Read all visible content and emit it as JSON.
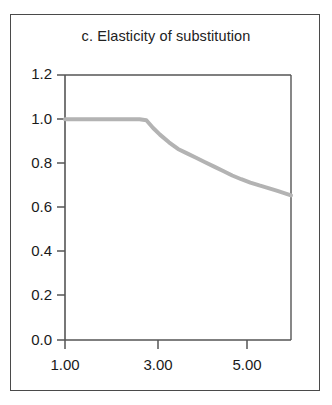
{
  "figure": {
    "title": "c. Elasticity of substitution",
    "background_color": "#ffffff",
    "frame_color": "#4a4a4a",
    "axis_color": "#555555",
    "curve_color": "#b3b3b3"
  },
  "chart_data": {
    "type": "line",
    "title": "c. Elasticity of substitution",
    "xlabel": "",
    "ylabel": "",
    "xlim": [
      1.0,
      6.0
    ],
    "ylim": [
      0.0,
      1.2
    ],
    "grid": false,
    "legend": null,
    "xticks": [
      1.0,
      3.0,
      5.0
    ],
    "xtick_labels": [
      "1.00",
      "3.00",
      "5.00"
    ],
    "yticks": [
      0.0,
      0.2,
      0.4,
      0.6,
      0.8,
      1.0,
      1.2
    ],
    "ytick_labels": [
      "0.0",
      "0.2",
      "0.4",
      "0.6",
      "0.8",
      "1.0",
      "1.2"
    ],
    "series": [
      {
        "name": "Elasticity of substitution",
        "color": "#b3b3b3",
        "x": [
          1.0,
          1.25,
          1.5,
          1.75,
          2.0,
          2.25,
          2.5,
          2.65,
          2.8,
          2.95,
          3.1,
          3.3,
          3.5,
          3.7,
          3.9,
          4.1,
          4.3,
          4.5,
          4.7,
          4.9,
          5.1,
          5.3,
          5.5,
          5.7,
          5.9,
          6.0
        ],
        "y": [
          1.0,
          1.0,
          1.0,
          1.0,
          1.0,
          1.0,
          1.0,
          1.0,
          0.995,
          0.96,
          0.93,
          0.895,
          0.865,
          0.845,
          0.825,
          0.805,
          0.785,
          0.765,
          0.745,
          0.728,
          0.713,
          0.7,
          0.688,
          0.675,
          0.662,
          0.655
        ]
      }
    ]
  },
  "y_tick_positions": [
    {
      "label": "1.2",
      "top": 65
    },
    {
      "label": "1.0",
      "top": 110
    },
    {
      "label": "0.8",
      "top": 154
    },
    {
      "label": "0.6",
      "top": 198
    },
    {
      "label": "0.4",
      "top": 242
    },
    {
      "label": "0.2",
      "top": 286
    },
    {
      "label": "0.0",
      "top": 330
    }
  ],
  "x_tick_positions": [
    {
      "label": "1.00",
      "left": 35
    },
    {
      "label": "3.00",
      "left": 128
    },
    {
      "label": "5.00",
      "left": 217
    }
  ]
}
